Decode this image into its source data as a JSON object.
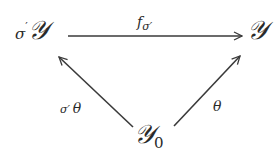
{
  "diagram": {
    "type": "commutative-triangle",
    "nodes": {
      "top_left": {
        "prefix": "σ",
        "prime": "′",
        "symbol": "𝒴"
      },
      "top_right": {
        "symbol": "𝒴"
      },
      "bottom": {
        "symbol": "𝒴",
        "subscript": "0"
      }
    },
    "edges": {
      "top": {
        "from": "top_left",
        "to": "top_right",
        "label_main": "f",
        "label_sub": "σ′"
      },
      "left": {
        "from": "bottom",
        "to": "top_left",
        "label_prefix": "σ′",
        "label_main": "θ"
      },
      "right": {
        "from": "bottom",
        "to": "top_right",
        "label_main": "θ"
      }
    },
    "stroke_color": "#3a3a3a"
  }
}
